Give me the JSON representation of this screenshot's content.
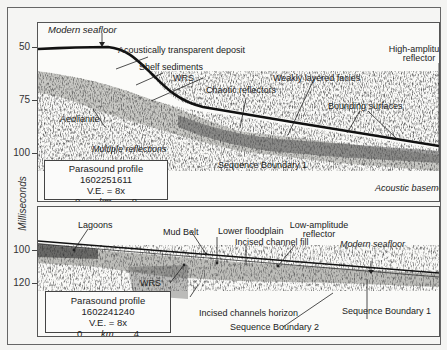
{
  "figure": {
    "y_axis_label": "Milliseconds",
    "top_panel": {
      "ticks": [
        "50",
        "75",
        "100"
      ],
      "labels": {
        "modern_seafloor": "Modern seafloor",
        "acoustically_transparent": "Acoustically transparent deposit",
        "shelf_sediments": "Shelf sediments",
        "wrs": "WRS",
        "aeolianite": "Aeolianite",
        "chaotic_reflectors": "Chaotic reflectors",
        "weakly_layered": "Weakly layered facies",
        "high_amplitude_1": "High-amplitude",
        "high_amplitude_2": "reflector",
        "bounding_surfaces": "Bounding surfaces",
        "multiple_reflections": "Multiple reflections",
        "sequence_boundary_1": "Sequence Boundary 1",
        "acoustic_basement": "Acoustic basement"
      },
      "infobox": {
        "profile": "Parasound profile 1602251611",
        "ve": "V.E. = 8x",
        "scale_start": "0",
        "scale_unit": "km",
        "scale_end": "8"
      }
    },
    "bottom_panel": {
      "ticks": [
        "100",
        "120"
      ],
      "labels": {
        "lagoons": "Lagoons",
        "mud_belt": "Mud Belt",
        "lower_floodplain": "Lower floodplain",
        "incised_channel_fill": "Incised channel fill",
        "low_amplitude_1": "Low-amplitude",
        "low_amplitude_2": "reflector",
        "modern_seafloor": "Modern seafloor",
        "wrs": "WRS",
        "incised_channels_horizon": "Incised channels horizon",
        "sequence_boundary_1": "Sequence Boundary 1",
        "sequence_boundary_2": "Sequence Boundary 2"
      },
      "infobox": {
        "profile": "Parasound profile 1602241240",
        "ve": "V.E. = 8x",
        "scale_start": "0",
        "scale_unit": "km",
        "scale_end": "4"
      }
    }
  }
}
